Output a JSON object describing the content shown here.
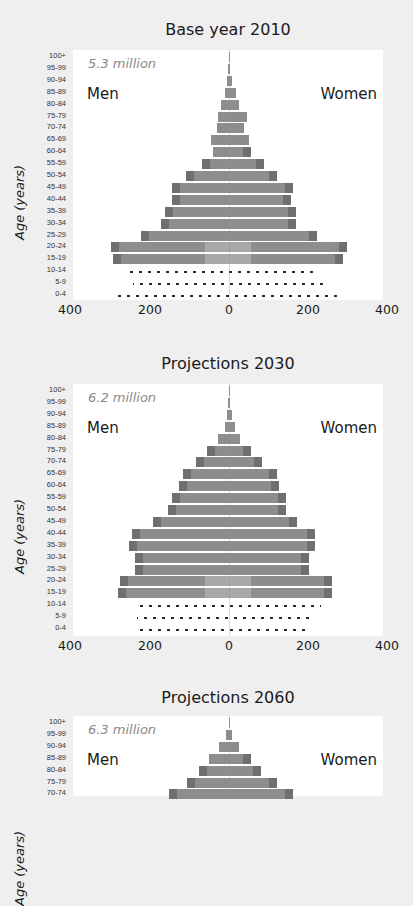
{
  "chart_data": [
    {
      "type": "bar",
      "subtype": "population-pyramid",
      "title": "Base year 2010",
      "total_label": "5.3 million",
      "left_label": "Men",
      "right_label": "Women",
      "ylabel": "Age (years)",
      "xlabel": "",
      "xticks": [
        "400",
        "200",
        "0",
        "200",
        "400"
      ],
      "xlim": [
        -400,
        400
      ],
      "categories": [
        "100+",
        "95-99",
        "90-94",
        "85-89",
        "80-84",
        "75-79",
        "70-74",
        "65-69",
        "60-64",
        "55-59",
        "50-54",
        "45-49",
        "40-44",
        "35-39",
        "30-34",
        "25-29",
        "20-24",
        "15-19",
        "10-14",
        "5-9",
        "0-4"
      ],
      "series": [
        {
          "name": "Men",
          "values": [
            1,
            2,
            5,
            10,
            20,
            28,
            30,
            45,
            40,
            68,
            108,
            144,
            144,
            161,
            171,
            222,
            297,
            292,
            257,
            242,
            287
          ]
        },
        {
          "name": "Women",
          "values": [
            1,
            3,
            8,
            18,
            25,
            45,
            38,
            50,
            55,
            88,
            121,
            161,
            156,
            169,
            169,
            222,
            297,
            287,
            224,
            242,
            282
          ]
        }
      ],
      "projected_rows": [
        "10-14",
        "5-9",
        "0-4"
      ],
      "grid": false,
      "legend": "inline labels Men (left) / Women (right)"
    },
    {
      "type": "bar",
      "subtype": "population-pyramid",
      "title": "Projections 2030",
      "total_label": "6.2 million",
      "left_label": "Men",
      "right_label": "Women",
      "ylabel": "Age (years)",
      "xlabel": "",
      "xticks": [
        "400",
        "200",
        "0",
        "200",
        "400"
      ],
      "xlim": [
        -400,
        400
      ],
      "categories": [
        "100+",
        "95-99",
        "90-94",
        "85-89",
        "80-84",
        "75-79",
        "70-74",
        "65-69",
        "60-64",
        "55-59",
        "50-54",
        "45-49",
        "40-44",
        "35-39",
        "30-34",
        "25-29",
        "20-24",
        "15-19",
        "10-14",
        "5-9",
        "0-4"
      ],
      "series": [
        {
          "name": "Men",
          "values": [
            1,
            3,
            6,
            10,
            28,
            55,
            82,
            115,
            126,
            143,
            153,
            191,
            244,
            252,
            237,
            237,
            275,
            279,
            232,
            232,
            232
          ]
        },
        {
          "name": "Women",
          "values": [
            1,
            3,
            8,
            14,
            28,
            55,
            82,
            120,
            126,
            143,
            143,
            172,
            217,
            217,
            200,
            200,
            260,
            260,
            232,
            217,
            200
          ]
        }
      ],
      "projected_rows": [
        "10-14",
        "5-9",
        "0-4"
      ],
      "grid": false
    },
    {
      "type": "bar",
      "subtype": "population-pyramid",
      "title": "Projections 2060",
      "total_label": "6.3 million",
      "left_label": "Men",
      "right_label": "Women",
      "ylabel": "Age (years)",
      "xlabel": "",
      "xticks": [],
      "xlim": [
        -400,
        400
      ],
      "categories": [
        "100+",
        "95-99",
        "90-94",
        "85-89",
        "80-84",
        "75-79",
        "70-74"
      ],
      "series": [
        {
          "name": "Men",
          "values": [
            1,
            8,
            25,
            50,
            75,
            105,
            150
          ]
        },
        {
          "name": "Women",
          "values": [
            1,
            8,
            25,
            55,
            80,
            120,
            160
          ]
        }
      ],
      "note": "Chart cropped at bottom of screenshot; only top rows visible"
    }
  ],
  "colors": {
    "page_background": "#efefef",
    "plot_background": "#ffffff",
    "bar": "#8d8d8d",
    "bar_edge": "#6f6f6f",
    "bar_center_light": "#a8a8a8",
    "dots": "#222222",
    "text": "#1a1a1a",
    "total_label": "#8a8a8a"
  }
}
